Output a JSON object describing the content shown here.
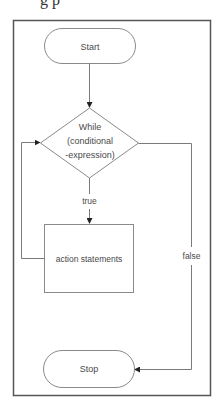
{
  "header": {
    "cut_text": "g p"
  },
  "flowchart": {
    "nodes": {
      "start": {
        "type": "terminal",
        "label": "Start"
      },
      "condition": {
        "type": "decision",
        "lines": [
          "While",
          "(conditional",
          "-expression)"
        ]
      },
      "action": {
        "type": "process",
        "label": "action statements"
      },
      "stop": {
        "type": "terminal",
        "label": "Stop"
      }
    },
    "edges": [
      {
        "from": "start",
        "to": "condition",
        "label": ""
      },
      {
        "from": "condition",
        "to": "action",
        "label": "true"
      },
      {
        "from": "action",
        "to": "condition",
        "label": ""
      },
      {
        "from": "condition",
        "to": "stop",
        "label": "false"
      }
    ]
  },
  "colors": {
    "frame": "#555555",
    "stroke": "#7a7a7a",
    "text": "#4a4a4a",
    "arrow": "#222222"
  }
}
